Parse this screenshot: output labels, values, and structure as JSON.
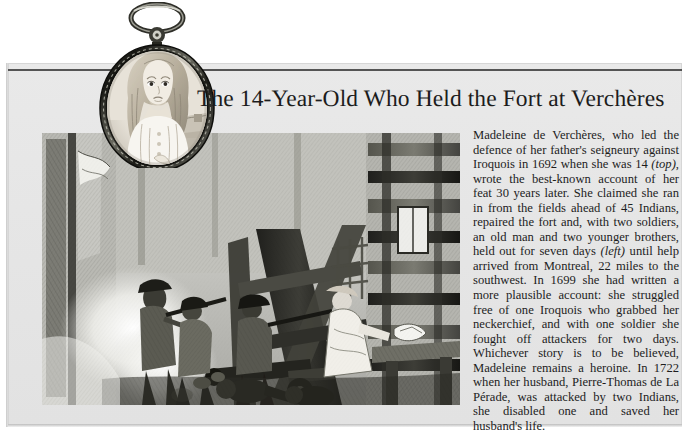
{
  "document": {
    "type": "scanned-book-page",
    "headline": "The 14-Year-Old Who Held the Fort at Verchères",
    "body_paragraph": "Madeleine de Verchères, who led the defence of her father's seigneury against Iroquois in 1692 when she was 14 (top), wrote the best-known account of her feat 30 years later. She claimed she ran in from the fields ahead of 45 Indians, repaired the fort and, with two soldiers, an old man and two younger brothers, held out for seven days (left) until help arrived from Montreal, 22 miles to the southwest. In 1699 she had written a more plausible account: she struggled free of one Iroquois who grabbed her neckerchief, and with one soldier she fought off attackers for two days. Whichever story is to be believed, Madeleine remains a heroine. In 1722 when her husband, Pierre-Thomas de La Pérade, was attacked by two Indians, she disabled one and saved her husband's life.",
    "body_segments": [
      {
        "text": "Madeleine de Verchères, who led the defence of her father's seigneury against Iroquois in 1692 when she was 14 ",
        "style": "roman"
      },
      {
        "text": "(top)",
        "style": "italic"
      },
      {
        "text": ", wrote the best-known account of her feat 30 years later. She claimed she ran in from the fields ahead of 45 Indians, repaired the fort and, with two soldiers, an old man and two younger brothers, held out for seven days ",
        "style": "roman"
      },
      {
        "text": "(left)",
        "style": "italic"
      },
      {
        "text": " until help arrived from Montreal, 22 miles to the southwest. In 1699 she had written a more plausible account: she struggled free of one Iroquois who grabbed her neckerchief, and with one soldier she fought off attackers for two days. Whichever story is to be believed, Madeleine remains a heroine. In 1722 when her husband, Pierre-Thomas de La Pérade, was attacked by two Indians, she disabled one and saved her husband's life.",
        "style": "roman"
      }
    ],
    "figures": [
      {
        "name": "locket-portrait",
        "caption_reference": "(top)",
        "description": "Oval miniature portrait in an ornate metal locket frame with suspension ring, showing a young blonde girl with long wavy hair in a white dress, landscape visible at right"
      },
      {
        "name": "fort-defence-engraving",
        "caption_reference": "(left)",
        "description": "Historical engraving of the defence of the fort at Verchères, showing armed figures, timber palisade braces, a cannon, powder smoke and fallen attackers"
      }
    ],
    "colors": {
      "page_background": "#e6e6e6",
      "scan_background": "#ffffff",
      "ink": "#1d1d1d",
      "rule": "#3a3a3a",
      "plate_paper": "#cfcfca"
    }
  }
}
